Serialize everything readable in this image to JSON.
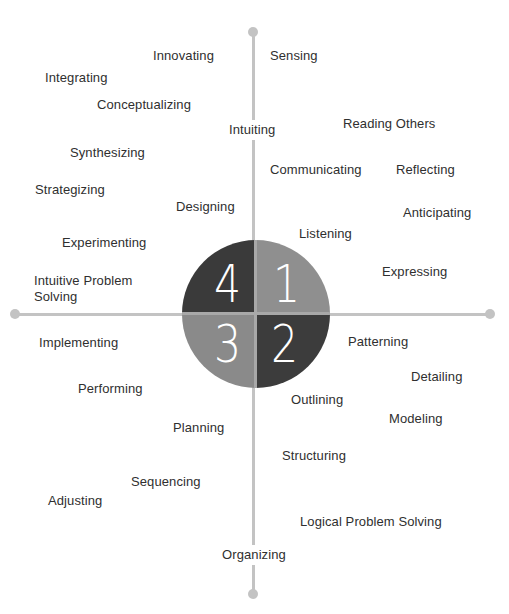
{
  "diagram": {
    "type": "four-quadrant thinking styles diagram",
    "colors": {
      "axis": "#c3c3c3",
      "quadrant_1": "#8f8f8f",
      "quadrant_2": "#3c3c3c",
      "quadrant_3": "#8a8a8a",
      "quadrant_4": "#3a3a3a",
      "text": "#2f2f2f"
    },
    "quadrants": [
      {
        "number": "4",
        "position": "top-left"
      },
      {
        "number": "1",
        "position": "top-right"
      },
      {
        "number": "3",
        "position": "bottom-left"
      },
      {
        "number": "2",
        "position": "bottom-right"
      }
    ],
    "axis_labels": {
      "top_right": "Sensing",
      "top_center": "Intuiting",
      "bottom_center": "Organizing"
    },
    "top_left_labels": [
      {
        "text": "Innovating",
        "x": 153,
        "y": 48
      },
      {
        "text": "Integrating",
        "x": 45,
        "y": 70
      },
      {
        "text": "Conceptualizing",
        "x": 97,
        "y": 97
      },
      {
        "text": "Synthesizing",
        "x": 70,
        "y": 145
      },
      {
        "text": "Strategizing",
        "x": 35,
        "y": 182
      },
      {
        "text": "Designing",
        "x": 176,
        "y": 199
      },
      {
        "text": "Experimenting",
        "x": 62,
        "y": 235
      },
      {
        "text": "Intuitive Problem Solving",
        "x": 34,
        "y": 273
      }
    ],
    "top_right_labels": [
      {
        "text": "Reading Others",
        "x": 343,
        "y": 116
      },
      {
        "text": "Communicating",
        "x": 270,
        "y": 162
      },
      {
        "text": "Reflecting",
        "x": 396,
        "y": 162
      },
      {
        "text": "Anticipating",
        "x": 403,
        "y": 205
      },
      {
        "text": "Listening",
        "x": 299,
        "y": 226
      },
      {
        "text": "Expressing",
        "x": 382,
        "y": 264
      }
    ],
    "bottom_left_labels": [
      {
        "text": "Implementing",
        "x": 39,
        "y": 335
      },
      {
        "text": "Performing",
        "x": 78,
        "y": 381
      },
      {
        "text": "Planning",
        "x": 173,
        "y": 420
      },
      {
        "text": "Sequencing",
        "x": 131,
        "y": 474
      },
      {
        "text": "Adjusting",
        "x": 48,
        "y": 493
      }
    ],
    "bottom_right_labels": [
      {
        "text": "Patterning",
        "x": 348,
        "y": 334
      },
      {
        "text": "Detailing",
        "x": 411,
        "y": 369
      },
      {
        "text": "Outlining",
        "x": 291,
        "y": 392
      },
      {
        "text": "Modeling",
        "x": 389,
        "y": 411
      },
      {
        "text": "Structuring",
        "x": 282,
        "y": 448
      },
      {
        "text": "Logical Problem Solving",
        "x": 300,
        "y": 514
      }
    ]
  }
}
